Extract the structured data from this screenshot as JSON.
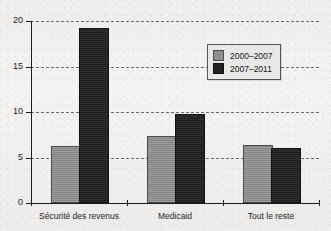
{
  "chart_data": {
    "type": "bar",
    "title": "",
    "subtitle": "",
    "xlabel": "",
    "ylabel": "",
    "categories": [
      "Sécurité des revenus",
      "Medicaid",
      "Tout le reste"
    ],
    "series": [
      {
        "name": "2000–2007",
        "color": "#8f8f8f",
        "values": [
          6.1,
          7.1,
          6.2
        ]
      },
      {
        "name": "2007–2011",
        "color": "#232323",
        "values": [
          19.0,
          9.6,
          5.8
        ]
      }
    ],
    "ylim": [
      0,
      20
    ],
    "yticks": [
      0,
      5,
      10,
      15,
      20
    ],
    "ytick_labels": [
      "0",
      "5",
      "10",
      "15",
      "20"
    ],
    "grid": "horizontal-dashed",
    "legend_position": "top-right",
    "annotations": []
  },
  "legend": {
    "items": [
      {
        "label": "2000–2007",
        "swatch": "gray-swatch"
      },
      {
        "label": "2007–2011",
        "swatch": "dark-swatch"
      }
    ]
  },
  "axes": {
    "y_tick_labels": [
      "20",
      "15",
      "10",
      "5",
      "0"
    ],
    "x_tick_labels": [
      "Sécurité des revenus",
      "Medicaid",
      "Tout le reste"
    ]
  },
  "page_background": {
    "ghost_text_top": "bleed-through scan text",
    "paper_color": "#f1f0ee"
  }
}
